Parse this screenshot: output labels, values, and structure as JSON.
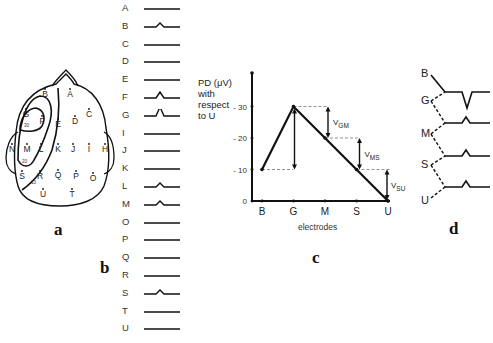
{
  "panels": {
    "a": {
      "label": "a",
      "electrodes": [
        {
          "id": "A",
          "x": 70,
          "y": 97
        },
        {
          "id": "B",
          "x": 45,
          "y": 97
        },
        {
          "id": "C",
          "x": 89,
          "y": 117
        },
        {
          "id": "D",
          "x": 75,
          "y": 124
        },
        {
          "id": "E",
          "x": 58,
          "y": 127
        },
        {
          "id": "F",
          "x": 42,
          "y": 124
        },
        {
          "id": "G",
          "x": 26,
          "y": 117
        },
        {
          "id": "H",
          "x": 105,
          "y": 152
        },
        {
          "id": "I",
          "x": 89,
          "y": 152
        },
        {
          "id": "J",
          "x": 73,
          "y": 152
        },
        {
          "id": "K",
          "x": 58,
          "y": 152
        },
        {
          "id": "L",
          "x": 41,
          "y": 152
        },
        {
          "id": "M",
          "x": 27,
          "y": 152
        },
        {
          "id": "N",
          "x": 12,
          "y": 152
        },
        {
          "id": "O",
          "x": 93,
          "y": 181
        },
        {
          "id": "P",
          "x": 76,
          "y": 179
        },
        {
          "id": "Q",
          "x": 58,
          "y": 178
        },
        {
          "id": "R",
          "x": 40,
          "y": 179
        },
        {
          "id": "S",
          "x": 22,
          "y": 179
        },
        {
          "id": "T",
          "x": 72,
          "y": 197
        },
        {
          "id": "U",
          "x": 43,
          "y": 197
        }
      ],
      "contour_labels": [
        {
          "text": "30",
          "x": 24,
          "y": 127
        },
        {
          "text": "20",
          "x": 22,
          "y": 163
        },
        {
          "text": "10",
          "x": 31,
          "y": 184
        }
      ]
    },
    "b": {
      "label": "b",
      "traces": [
        {
          "electrode": "A",
          "spike": "none"
        },
        {
          "electrode": "B",
          "spike": "small"
        },
        {
          "electrode": "C",
          "spike": "none"
        },
        {
          "electrode": "D",
          "spike": "none"
        },
        {
          "electrode": "E",
          "spike": "none"
        },
        {
          "electrode": "F",
          "spike": "medium"
        },
        {
          "electrode": "G",
          "spike": "large"
        },
        {
          "electrode": "I",
          "spike": "none"
        },
        {
          "electrode": "J",
          "spike": "none"
        },
        {
          "electrode": "K",
          "spike": "none"
        },
        {
          "electrode": "L",
          "spike": "small"
        },
        {
          "electrode": "M",
          "spike": "small"
        },
        {
          "electrode": "O",
          "spike": "none"
        },
        {
          "electrode": "P",
          "spike": "none"
        },
        {
          "electrode": "Q",
          "spike": "none"
        },
        {
          "electrode": "R",
          "spike": "none"
        },
        {
          "electrode": "S",
          "spike": "small"
        },
        {
          "electrode": "T",
          "spike": "none"
        },
        {
          "electrode": "U",
          "spike": "none"
        }
      ]
    },
    "c": {
      "label": "c",
      "ylabel_lines": [
        "PD (μV)",
        "with",
        "respect",
        "to U"
      ],
      "xlabel": "electrodes",
      "annotations": [
        {
          "text": "V",
          "sub": "GM"
        },
        {
          "text": "V",
          "sub": "MS"
        },
        {
          "text": "V",
          "sub": "SU"
        }
      ]
    },
    "d": {
      "label": "d",
      "electrodes": [
        "B",
        "G",
        "M",
        "S",
        "U"
      ]
    }
  },
  "chart_data": {
    "type": "line",
    "title": "",
    "categories": [
      "B",
      "G",
      "M",
      "S",
      "U"
    ],
    "values": [
      10,
      30,
      20,
      10,
      0
    ],
    "xlabel": "electrodes",
    "ylabel": "PD (μV) with respect to U",
    "yticks": [
      0,
      10,
      20,
      30
    ],
    "ylim": [
      0,
      40
    ],
    "grid": false,
    "annotations": [
      "V_GM = 10",
      "V_MS = 10",
      "V_SU = 10"
    ],
    "dashed_reference_lines": [
      30,
      20,
      10
    ]
  }
}
